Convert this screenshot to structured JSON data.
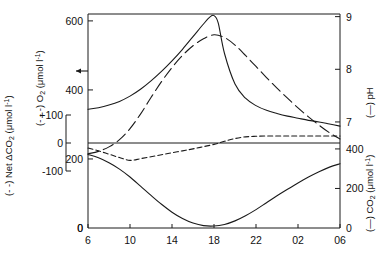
{
  "chart_data": {
    "type": "line",
    "title": "",
    "xlabel": "",
    "x_tick_labels": [
      "6",
      "10",
      "14",
      "18",
      "22",
      "02",
      "06"
    ],
    "x_tick_values": [
      6,
      10,
      14,
      18,
      22,
      26,
      30
    ],
    "xlim": [
      6,
      30
    ],
    "grid": false,
    "legend_position": "axis-titles",
    "axes": [
      {
        "id": "net_co2",
        "side": "left-outer",
        "label": "(- -) Net ΔCO₂ (μmol l⁻¹)",
        "label_prefix": "(- -) Net ΔCO",
        "label_sub": "2",
        "label_unit": " (μmol l",
        "label_sup": "-1",
        "label_close": ")",
        "tick_labels": [
          "+100",
          "0",
          "-100"
        ],
        "tick_values": [
          100,
          0,
          -100
        ],
        "lim": [
          -100,
          100
        ]
      },
      {
        "id": "o2",
        "side": "left-inner",
        "label": "(- - -) O₂ (μmol l⁻¹)",
        "label_prefix": "(- - -) O",
        "label_sub": "2",
        "label_unit": " (μmol l",
        "label_sup": "-1",
        "label_close": ")",
        "tick_labels": [
          "600",
          "400",
          "200",
          "0"
        ],
        "tick_values": [
          600,
          400,
          200,
          0
        ],
        "lim": [
          0,
          620
        ],
        "marker_label": "arrow-marker",
        "marker_value": 300
      },
      {
        "id": "ph",
        "side": "right-upper",
        "label": "(—) pH",
        "label_prefix": "(—) pH",
        "tick_labels": [
          "9",
          "8",
          "7"
        ],
        "tick_values": [
          9,
          8,
          7
        ],
        "lim": [
          6.6,
          9.05
        ]
      },
      {
        "id": "co2",
        "side": "right-lower",
        "label": "(—) CO₂ (μmol l⁻¹)",
        "label_prefix": "(—) CO",
        "label_sub": "2",
        "label_unit": " (μmol l",
        "label_sup": "-1",
        "label_close": ")",
        "tick_labels": [
          "400",
          "200",
          "0"
        ],
        "tick_values": [
          400,
          200,
          0
        ],
        "lim": [
          0,
          430
        ]
      }
    ],
    "series": [
      {
        "name": "O2",
        "axis": "o2",
        "style": "long-dashed",
        "x": [
          6,
          7,
          8,
          9,
          10,
          11,
          12,
          13,
          14,
          15,
          16,
          17,
          18,
          19,
          20,
          21,
          22,
          23,
          24,
          25,
          26,
          27,
          28,
          29,
          30
        ],
        "values": [
          215,
          222,
          235,
          256,
          288,
          330,
          378,
          424,
          465,
          500,
          528,
          548,
          560,
          552,
          530,
          500,
          468,
          436,
          405,
          376,
          348,
          322,
          298,
          276,
          258
        ]
      },
      {
        "name": "pH",
        "axis": "ph",
        "style": "solid",
        "x": [
          6,
          7,
          8,
          9,
          10,
          11,
          12,
          13,
          14,
          15,
          16,
          17,
          17.6,
          18,
          18.4,
          19,
          20,
          21,
          22,
          23,
          24,
          25,
          26,
          27,
          28,
          29,
          30
        ],
        "values": [
          7.24,
          7.27,
          7.32,
          7.39,
          7.49,
          7.62,
          7.78,
          7.96,
          8.16,
          8.38,
          8.62,
          8.86,
          8.99,
          9.02,
          8.88,
          8.3,
          7.72,
          7.45,
          7.31,
          7.22,
          7.16,
          7.11,
          7.07,
          7.03,
          7.0,
          6.96,
          6.92
        ]
      },
      {
        "name": "Net ΔCO2",
        "axis": "net_co2",
        "style": "short-dashed",
        "x": [
          6,
          7,
          8,
          9,
          10,
          11,
          12,
          13,
          14,
          15,
          16,
          17,
          18,
          19,
          20,
          21,
          22,
          23,
          24,
          25,
          26,
          27,
          28,
          29,
          30
        ],
        "values": [
          -18,
          -28,
          -40,
          -52,
          -62,
          -56,
          -49,
          -42,
          -35,
          -28,
          -21,
          -13,
          -5,
          6,
          16,
          22,
          24,
          25,
          25,
          25,
          25,
          25,
          25,
          25,
          25
        ]
      },
      {
        "name": "CO2",
        "axis": "co2",
        "style": "solid",
        "x": [
          6,
          7,
          8,
          9,
          10,
          11,
          12,
          13,
          14,
          15,
          16,
          17,
          18,
          19,
          20,
          21,
          22,
          23,
          24,
          25,
          26,
          27,
          28,
          29,
          30
        ],
        "values": [
          372,
          355,
          330,
          298,
          258,
          212,
          165,
          120,
          80,
          48,
          25,
          12,
          10,
          18,
          36,
          62,
          93,
          128,
          163,
          196,
          228,
          258,
          285,
          308,
          325
        ]
      }
    ]
  }
}
